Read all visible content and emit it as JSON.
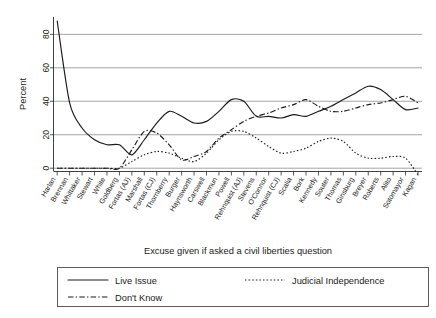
{
  "chart_data": {
    "type": "line",
    "title": "",
    "xlabel": "Excuse given if asked a civil liberties question",
    "ylabel": "Percent",
    "ylim": [
      -6,
      92
    ],
    "yticks": [
      0,
      20,
      40,
      60,
      80
    ],
    "ytick_labels": [
      "0",
      "20",
      "40",
      "60",
      "80"
    ],
    "grid": "horizontal",
    "legend_position": "below-plot",
    "categories": [
      "Harlan",
      "Brennan",
      "Whittaker",
      "Stewart",
      "White",
      "Goldberg",
      "Fortas (AJ)",
      "Marshall",
      "Fortas (CJ)",
      "Thornberry",
      "Burger",
      "Haynsworth",
      "Carswell",
      "Blackmun",
      "Powell",
      "Rehnquist (AJ)",
      "Stevens",
      "O'Connor",
      "Rehnquist (CJ)",
      "Scalia",
      "Bork",
      "Kennedy",
      "Souter",
      "Thomas",
      "Ginsburg",
      "Breyer",
      "Roberts",
      "Alito",
      "Sotomayor",
      "Kagan"
    ],
    "series": [
      {
        "name": "Live Issue",
        "style": "solid",
        "values": [
          88,
          39,
          24,
          17,
          14,
          14,
          8,
          17,
          27,
          34,
          31,
          27,
          28,
          34,
          41,
          40,
          31,
          31,
          30,
          32,
          31,
          34,
          37,
          41,
          45,
          49,
          47,
          41,
          35,
          36
        ]
      },
      {
        "name": "Don't Know",
        "style": "dash-dot",
        "values": [
          0,
          0,
          0,
          0,
          0,
          0,
          11,
          22,
          21,
          14,
          5,
          7,
          10,
          18,
          23,
          28,
          31,
          33,
          36,
          38,
          41,
          37,
          34,
          34,
          36,
          38,
          39,
          41,
          43,
          39
        ]
      },
      {
        "name": "Judicial Independence",
        "style": "dotted",
        "values": [
          0,
          0,
          0,
          0,
          0,
          0,
          4,
          8,
          10,
          9,
          6,
          4,
          9,
          17,
          22,
          22,
          18,
          13,
          9,
          10,
          12,
          16,
          18,
          16,
          9,
          6,
          6,
          7,
          6,
          -4
        ]
      }
    ]
  },
  "axis": {
    "y_title": "Percent",
    "x_title": "Excuse given if asked a civil liberties question"
  },
  "legend": {
    "entries": [
      {
        "label": "Live Issue",
        "style": "solid"
      },
      {
        "label": "Judicial Independence",
        "style": "dotted"
      },
      {
        "label": "Don't Know",
        "style": "dash-dot"
      }
    ]
  }
}
